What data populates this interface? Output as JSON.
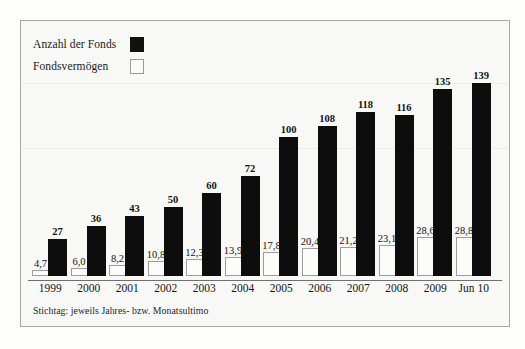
{
  "chart_data": {
    "type": "bar",
    "title": "",
    "subtitle": "",
    "xlabel": "",
    "ylabel": "",
    "grid": false,
    "legend_position": "top-left",
    "categories": [
      "1999",
      "2000",
      "2001",
      "2002",
      "2003",
      "2004",
      "2005",
      "2006",
      "2007",
      "2008",
      "2009",
      "Jun 10"
    ],
    "series": [
      {
        "name": "Anzahl der Fonds",
        "swatch": "filled-black-square",
        "color": "#0d0d0d",
        "values": [
          27,
          36,
          43,
          50,
          60,
          72,
          100,
          108,
          118,
          116,
          135,
          139
        ],
        "value_labels": [
          "27",
          "36",
          "43",
          "50",
          "60",
          "72",
          "100",
          "108",
          "118",
          "116",
          "135",
          "139"
        ],
        "axis_max": 160
      },
      {
        "name": "Fondsvermögen",
        "swatch": "hollow-white-square",
        "color": "#fcfcfb",
        "values": [
          4.7,
          6.0,
          8.2,
          10.8,
          12.3,
          13.9,
          17.8,
          20.4,
          21.2,
          23.1,
          28.6,
          28.8
        ],
        "value_labels": [
          "4,7",
          "6,0",
          "8,2",
          "10,8",
          "12,3",
          "13,9",
          "17,8",
          "20,4",
          "21,2",
          "23,1",
          "28,6",
          "28,8"
        ],
        "axis_max": 34
      }
    ],
    "annotations": [
      "Stichtag: jeweils Jahres- bzw. Monatsultimo"
    ]
  },
  "legend": {
    "items": [
      {
        "label": "Anzahl der Fonds",
        "swatch": "filled"
      },
      {
        "label": "Fondsvermögen",
        "swatch": "hollow"
      }
    ]
  },
  "footnote": {
    "text": "Stichtag: jeweils Jahres- bzw. Monatsultimo"
  },
  "colors": {
    "bar_dark": "#0d0d0d",
    "bar_light": "#fcfcfb",
    "bar_light_border": "#9d9d9d",
    "frame_border": "#a8a8a8",
    "page_background": "#f8f8f6",
    "axis": "#6f6f6f"
  }
}
